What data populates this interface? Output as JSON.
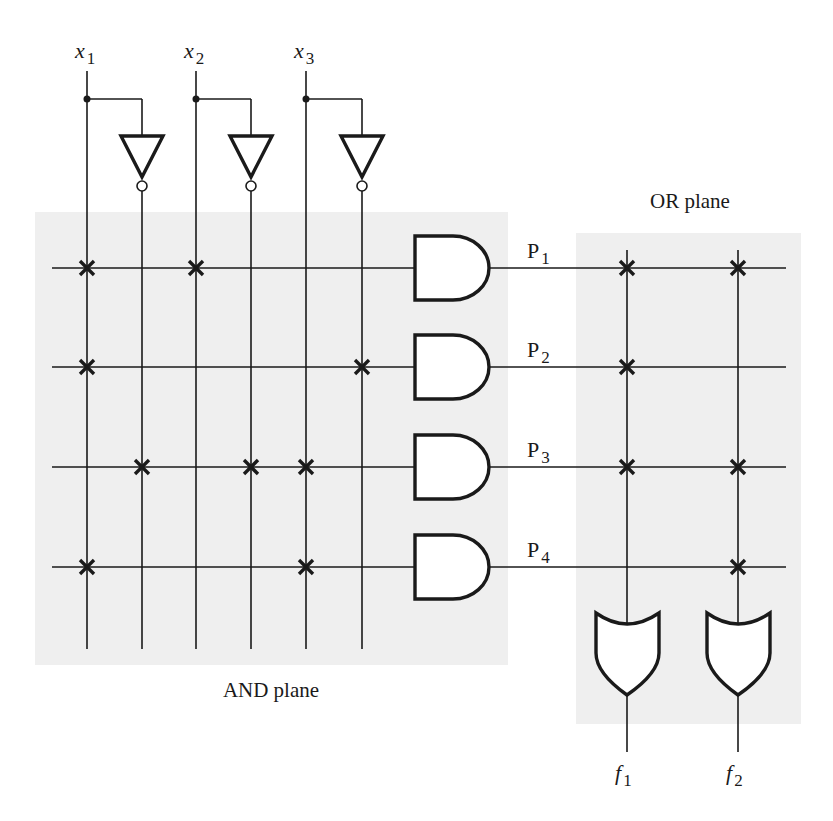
{
  "diagram": {
    "type": "PLA (programmable logic array)",
    "inputs": [
      {
        "name": "x",
        "sub": "1"
      },
      {
        "name": "x",
        "sub": "2"
      },
      {
        "name": "x",
        "sub": "3"
      }
    ],
    "outputs": [
      {
        "name": "f",
        "sub": "1"
      },
      {
        "name": "f",
        "sub": "2"
      }
    ],
    "product_terms": [
      {
        "name": "P",
        "sub": "1",
        "and_connections": [
          "x1",
          "x2"
        ],
        "or_connections": [
          "f1",
          "f2"
        ]
      },
      {
        "name": "P",
        "sub": "2",
        "and_connections": [
          "x1",
          "x3'"
        ],
        "or_connections": [
          "f1"
        ]
      },
      {
        "name": "P",
        "sub": "3",
        "and_connections": [
          "x1'",
          "x2'",
          "x3"
        ],
        "or_connections": [
          "f1",
          "f2"
        ]
      },
      {
        "name": "P",
        "sub": "4",
        "and_connections": [
          "x1",
          "x3"
        ],
        "or_connections": [
          "f2"
        ]
      }
    ],
    "labels": {
      "and_plane": "AND plane",
      "or_plane": "OR plane"
    },
    "colors": {
      "wire": "#1a1a1a",
      "plane_shade": "#efefef",
      "background": "#ffffff"
    }
  }
}
